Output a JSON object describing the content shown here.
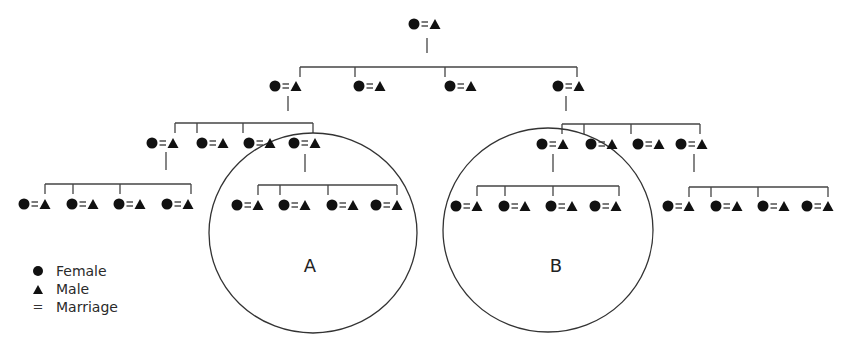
{
  "diagram": {
    "line_color": "#444444",
    "symbol_color": "#111111",
    "couple_symbol": {
      "female": "circle",
      "marriage": "=",
      "male": "triangle"
    },
    "generations": [
      {
        "level": 1,
        "couples": 1
      },
      {
        "level": 2,
        "couples": 4
      },
      {
        "level": 3,
        "couples": 8,
        "groups": [
          "left-4",
          "right-4"
        ]
      },
      {
        "level": 4,
        "couples": 16,
        "groups": [
          "far-left-4",
          "A-4",
          "B-4",
          "far-right-4"
        ]
      }
    ],
    "circles": [
      {
        "label": "A",
        "encloses": "descendants of 4th couple of left generation-3 group"
      },
      {
        "label": "B",
        "encloses": "descendants of 1st couple of right generation-3 group"
      }
    ]
  },
  "circle_labels": {
    "a": "A",
    "b": "B"
  },
  "legend": {
    "items": [
      {
        "symbol": "circle-icon",
        "glyph": "●",
        "label": "Female"
      },
      {
        "symbol": "triangle-icon",
        "glyph": "▲",
        "label": "Male"
      },
      {
        "symbol": "equals-icon",
        "glyph": "=",
        "label": "Marriage"
      }
    ]
  }
}
